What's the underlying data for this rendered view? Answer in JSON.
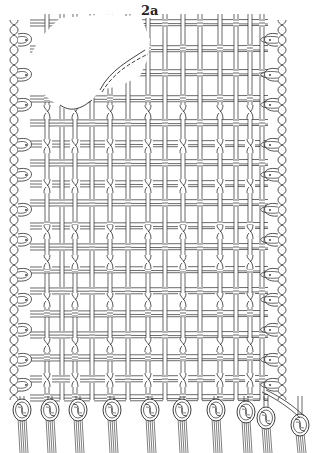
{
  "figure": {
    "label": "2a",
    "colors": {
      "ink": "#2a2a2a",
      "paper": "#ffffff",
      "hatch": "#8a8a8a"
    }
  },
  "structure": {
    "bounds": {
      "left": 30,
      "right": 268,
      "top": 14,
      "bottom": 400
    },
    "warp_columns_x": [
      47,
      62,
      75,
      92,
      110,
      128,
      148,
      165,
      183,
      200,
      220,
      236,
      250,
      262
    ],
    "twist_columns_x": [
      47,
      75,
      110,
      148,
      183,
      220,
      250
    ],
    "weft_band_y": [
      20,
      45,
      70,
      95,
      120,
      140,
      160,
      180,
      200,
      222,
      244,
      266,
      288,
      310,
      332,
      354,
      376,
      394
    ],
    "twist_rows_y": [
      112,
      146,
      186,
      232,
      262,
      300,
      345,
      380
    ],
    "lacuna": {
      "points": "60,18 110,14 125,16 140,24 150,40 148,58 140,76 120,86 100,90 92,100 70,112 50,100 30,80 28,60 40,38"
    },
    "left_selvedge_x": 14,
    "right_selvedge_x": 282,
    "selvedge_loops_y": [
      40,
      75,
      105,
      145,
      175,
      210,
      240,
      275,
      300,
      330,
      360,
      385
    ],
    "fringe_knots": [
      {
        "x": 22,
        "y": 410
      },
      {
        "x": 50,
        "y": 410
      },
      {
        "x": 78,
        "y": 410
      },
      {
        "x": 112,
        "y": 410
      },
      {
        "x": 150,
        "y": 410
      },
      {
        "x": 182,
        "y": 410
      },
      {
        "x": 216,
        "y": 410
      },
      {
        "x": 246,
        "y": 412
      },
      {
        "x": 266,
        "y": 418
      },
      {
        "x": 300,
        "y": 425
      }
    ]
  }
}
